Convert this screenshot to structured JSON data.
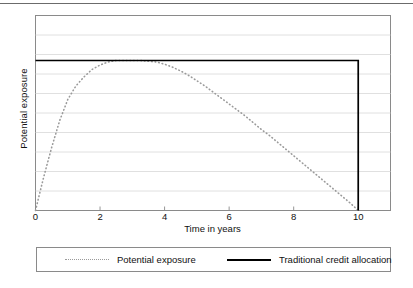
{
  "chart_data": {
    "type": "line",
    "title": "",
    "xlabel": "Time in years",
    "ylabel": "Potential exposure",
    "xlim": [
      0,
      11
    ],
    "ylim": [
      0,
      1.3
    ],
    "xticks": [
      0,
      2,
      4,
      6,
      8,
      10
    ],
    "xtick_labels": [
      "0",
      "2",
      "4",
      "6",
      "8",
      "10"
    ],
    "ytick_labels": [],
    "grid": "horizontal",
    "legend_position": "below-plot",
    "series": [
      {
        "name": "Potential exposure",
        "style": "dotted",
        "color": "#9a9a9a",
        "x": [
          0,
          0.25,
          0.5,
          0.75,
          1,
          1.25,
          1.5,
          1.75,
          2,
          2.25,
          2.5,
          2.75,
          3,
          3.25,
          3.5,
          3.75,
          4,
          4.25,
          4.5,
          4.75,
          5,
          5.25,
          5.5,
          5.75,
          6,
          6.25,
          6.5,
          6.75,
          7,
          7.25,
          7.5,
          7.75,
          8,
          8.25,
          8.5,
          8.75,
          9,
          9.25,
          9.5,
          9.75,
          10
        ],
        "y": [
          0.0,
          0.22,
          0.42,
          0.6,
          0.74,
          0.83,
          0.89,
          0.94,
          0.97,
          0.99,
          1.0,
          1.0,
          1.0,
          1.0,
          0.995,
          0.99,
          0.975,
          0.955,
          0.93,
          0.9,
          0.865,
          0.83,
          0.79,
          0.75,
          0.71,
          0.67,
          0.63,
          0.585,
          0.54,
          0.5,
          0.455,
          0.41,
          0.365,
          0.32,
          0.275,
          0.23,
          0.185,
          0.14,
          0.095,
          0.05,
          0.0
        ]
      },
      {
        "name": "Traditional credit allocation",
        "style": "solid",
        "color": "#000000",
        "x": [
          0,
          10,
          10
        ],
        "y": [
          1.0,
          1.0,
          0.0
        ]
      }
    ]
  },
  "legend": {
    "entries": [
      {
        "label": "Potential exposure",
        "style": "dotted"
      },
      {
        "label": "Traditional credit allocation",
        "style": "solid"
      }
    ]
  },
  "axes": {
    "x_title": "Time in years",
    "y_title": "Potential exposure"
  }
}
